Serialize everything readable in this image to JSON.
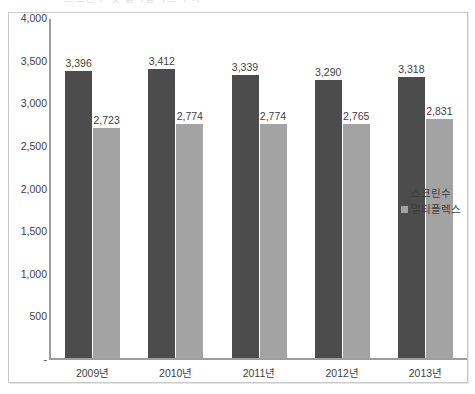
{
  "title_remnant": "스크린수 및 멀티플렉스 추이",
  "chart_data": {
    "type": "bar",
    "title": "",
    "xlabel": "",
    "ylabel": "",
    "grid": false,
    "legend_position": "right",
    "categories": [
      "2009년",
      "2010년",
      "2011년",
      "2012년",
      "2013년"
    ],
    "ylim": [
      0,
      4000
    ],
    "ytick_labels": [
      "-",
      "500",
      "1,000",
      "1,500",
      "2,000",
      "2,500",
      "3,000",
      "3,500",
      "4,000"
    ],
    "ytick_values": [
      0,
      500,
      1000,
      1500,
      2000,
      2500,
      3000,
      3500,
      4000
    ],
    "series": [
      {
        "name": "스크린수",
        "color": "#4c4c4c",
        "values": [
          3396,
          3412,
          3339,
          3290,
          3318
        ],
        "labels": [
          "3,396",
          "3,412",
          "3,339",
          "3,290",
          "3,318"
        ]
      },
      {
        "name": "멀티플렉스",
        "color": "#a3a3a3",
        "values": [
          2723,
          2774,
          2774,
          2765,
          2831
        ],
        "labels": [
          "2,723",
          "2,774",
          "2,774",
          "2,765",
          "2,831"
        ]
      }
    ]
  }
}
